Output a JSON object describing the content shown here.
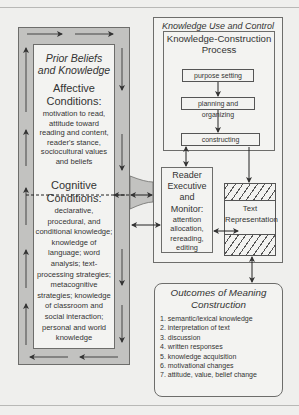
{
  "diagram": {
    "prior_beliefs": {
      "title": "Prior Beliefs and Knowledge",
      "title_line1": "Prior Beliefs",
      "title_line2": "and Knowledge",
      "affective": {
        "heading_line1": "Affective",
        "heading_line2": "Conditions:",
        "text": "motivation to read, attitude toward reading and content, reader's stance, sociocultural values and beliefs"
      },
      "cognitive": {
        "heading_line1": "Cognitive",
        "heading_line2": "Conditions:",
        "text": "declarative, procedural, and conditional knowledge; knowledge of language; word analysis; text-processing strategies; metacognitive strategies; knowledge of classroom and social interaction; personal and world knowledge"
      }
    },
    "knowledge_use": {
      "title": "Knowledge Use and Control",
      "construction_process": {
        "title_line1": "Knowledge-Construction",
        "title_line2": "Process",
        "steps": [
          "purpose setting",
          "planning and organizing",
          "constructing"
        ]
      },
      "reader_executive": {
        "heading_line1": "Reader",
        "heading_line2": "Executive",
        "heading_line3": "and Monitor:",
        "text": "attention allocation, rereading, editing"
      },
      "text_representation": {
        "line1": "Text",
        "line2": "Representation"
      }
    },
    "outcomes": {
      "title_line1": "Outcomes of Meaning",
      "title_line2": "Construction",
      "items": [
        "1. semantic/lexical knowledge",
        "2. interpretation of text",
        "3. discussion",
        "4. written responses",
        "5. knowledge acquisition",
        "6. motivational changes",
        "7. attitude, value, belief change"
      ]
    },
    "colors": {
      "background": "#efefed",
      "frame_gray": "#c2c2c0",
      "box_fill": "#f3f3f1",
      "stroke": "#555555"
    }
  }
}
